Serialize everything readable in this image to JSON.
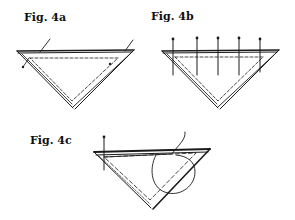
{
  "figures": [
    {
      "id": "fig-4a",
      "label": "Fig. 4a",
      "description": "Folded triangle with thread basting along dashed line, two ends of thread shown"
    },
    {
      "id": "fig-4b",
      "label": "Fig. 4b",
      "description": "Folded triangle pinned with five pins along top edge"
    },
    {
      "id": "fig-4c",
      "label": "Fig. 4c",
      "description": "Folded triangle with one pin and hand stitch looping over edge"
    }
  ],
  "colors": {
    "line": "#1a1a1a",
    "background": "#ffffff"
  }
}
